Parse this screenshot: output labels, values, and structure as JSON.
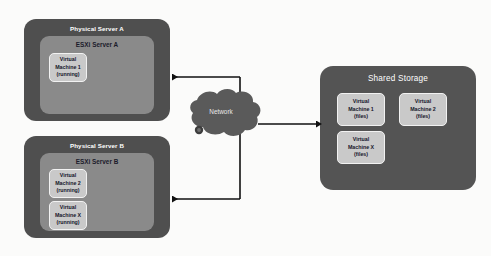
{
  "diagram": {
    "colors": {
      "background": "#fbfbfa",
      "physical_server": "#4f4f4f",
      "esxi_panel": "#8a8a8a",
      "vm_box": "#c9c9c9",
      "storage": "#545454",
      "cloud": "#5a5a5a",
      "connector": "#111111"
    }
  },
  "servers": [
    {
      "name": "Physical Server A",
      "hypervisor": "ESXi Server A",
      "vms": [
        {
          "line1": "Virtual",
          "line2": "Machine 1",
          "line3": "(running)"
        }
      ]
    },
    {
      "name": "Physical Server B",
      "hypervisor": "ESXi Server B",
      "vms": [
        {
          "line1": "Virtual",
          "line2": "Machine 2",
          "line3": "(running)"
        },
        {
          "line1": "Virtual",
          "line2": "Machine X",
          "line3": "(running)"
        }
      ]
    }
  ],
  "network": {
    "label": "Network"
  },
  "storage": {
    "title": "Shared Storage",
    "vms": [
      {
        "line1": "Virtual",
        "line2": "Machine 1",
        "line3": "(files)"
      },
      {
        "line1": "Virtual",
        "line2": "Machine 2",
        "line3": "(files)"
      },
      {
        "line1": "Virtual",
        "line2": "Machine X",
        "line3": "(files)"
      }
    ]
  }
}
